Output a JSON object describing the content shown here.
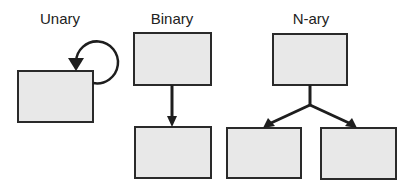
{
  "diagram": {
    "groups": [
      {
        "id": "unary",
        "label": "Unary",
        "nodes": [
          {
            "x": 18,
            "y": 71,
            "w": 75,
            "h": 51
          }
        ],
        "edges": [
          {
            "type": "self-loop",
            "node": 0
          }
        ]
      },
      {
        "id": "binary",
        "label": "Binary",
        "nodes": [
          {
            "x": 134,
            "y": 33,
            "w": 77,
            "h": 52
          },
          {
            "x": 135,
            "y": 127,
            "w": 76,
            "h": 51
          }
        ],
        "edges": [
          {
            "type": "arrow",
            "from": 0,
            "to": 1
          }
        ]
      },
      {
        "id": "nary",
        "label": "N-ary",
        "nodes": [
          {
            "x": 273,
            "y": 34,
            "w": 74,
            "h": 51
          },
          {
            "x": 227,
            "y": 128,
            "w": 74,
            "h": 50
          },
          {
            "x": 321,
            "y": 128,
            "w": 75,
            "h": 51
          }
        ],
        "edges": [
          {
            "type": "fork-arrow",
            "from": 0,
            "to": [
              1,
              2
            ]
          }
        ]
      }
    ],
    "colors": {
      "box_fill": "#e8e8e8",
      "stroke": "#1e1e1e",
      "text": "#222222"
    }
  }
}
